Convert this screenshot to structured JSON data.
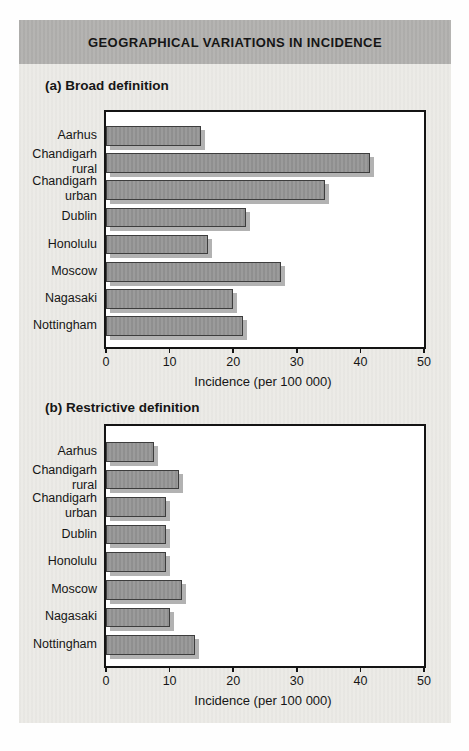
{
  "header": {
    "title": "GEOGRAPHICAL VARIATIONS IN INCIDENCE"
  },
  "chart_data": [
    {
      "type": "bar",
      "orientation": "horizontal",
      "section_label": "(a) Broad definition",
      "categories": [
        "Aarhus",
        "Chandigarh rural",
        "Chandigarh urban",
        "Dublin",
        "Honolulu",
        "Moscow",
        "Nagasaki",
        "Nottingham"
      ],
      "label_lines": [
        [
          "Aarhus"
        ],
        [
          "Chandigarh",
          "rural"
        ],
        [
          "Chandigarh",
          "urban"
        ],
        [
          "Dublin"
        ],
        [
          "Honolulu"
        ],
        [
          "Moscow"
        ],
        [
          "Nagasaki"
        ],
        [
          "Nottingham"
        ]
      ],
      "values": [
        15,
        41.5,
        34.5,
        22,
        16,
        27.5,
        20,
        21.5
      ],
      "xlabel": "Incidence (per 100 000)",
      "ylabel": "",
      "xlim": [
        0,
        50
      ],
      "xticks": [
        0,
        10,
        20,
        30,
        40,
        50
      ],
      "grid": false,
      "legend": false
    },
    {
      "type": "bar",
      "orientation": "horizontal",
      "section_label": "(b) Restrictive definition",
      "categories": [
        "Aarhus",
        "Chandigarh rural",
        "Chandigarh urban",
        "Dublin",
        "Honolulu",
        "Moscow",
        "Nagasaki",
        "Nottingham"
      ],
      "label_lines": [
        [
          "Aarhus"
        ],
        [
          "Chandigarh",
          "rural"
        ],
        [
          "Chandigarh",
          "urban"
        ],
        [
          "Dublin"
        ],
        [
          "Honolulu"
        ],
        [
          "Moscow"
        ],
        [
          "Nagasaki"
        ],
        [
          "Nottingham"
        ]
      ],
      "values": [
        7.5,
        11.5,
        9.5,
        9.5,
        9.5,
        12,
        10,
        14
      ],
      "xlabel": "Incidence (per 100 000)",
      "ylabel": "",
      "xlim": [
        0,
        50
      ],
      "xticks": [
        0,
        10,
        20,
        30,
        40,
        50
      ],
      "grid": false,
      "legend": false
    }
  ],
  "colors": {
    "header_bg": "#b3b2b0",
    "panel_bg": "#ecebe7",
    "bar_fill": "#979797",
    "bar_border": "#3d3d3d",
    "bar_shadow": "#b2b2b2",
    "plot_border": "#141414",
    "ink": "#181818"
  }
}
